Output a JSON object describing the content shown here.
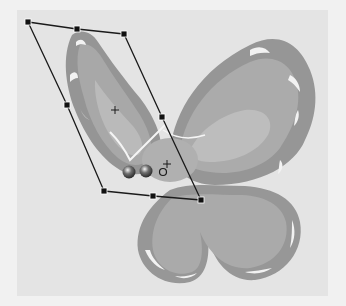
{
  "canvas": {
    "background": "#e4e4e4",
    "outer_background": "#f1f1f1",
    "object": "butterfly-clipart",
    "tool": "envelope-distort"
  },
  "colors": {
    "wing_outline": "#8f8f8f",
    "wing_mid": "#a5a5a5",
    "wing_inner": "#b8b8b8",
    "wing_highlight": "#efefef",
    "handle": "#111111",
    "bounding_line": "#1a1a1a"
  },
  "selection": {
    "handles": [
      {
        "id": "top-left",
        "x": 28,
        "y": 22
      },
      {
        "id": "top-middle",
        "x": 77,
        "y": 29
      },
      {
        "id": "top-right",
        "x": 124,
        "y": 34
      },
      {
        "id": "middle-left",
        "x": 67,
        "y": 105
      },
      {
        "id": "middle-right",
        "x": 162,
        "y": 117
      },
      {
        "id": "bottom-left",
        "x": 104,
        "y": 191
      },
      {
        "id": "bottom-middle",
        "x": 153,
        "y": 196
      },
      {
        "id": "bottom-right",
        "x": 201,
        "y": 200
      }
    ],
    "center_crosshair": {
      "x": 115,
      "y": 110
    },
    "pivot": {
      "x": 163,
      "y": 169
    }
  }
}
